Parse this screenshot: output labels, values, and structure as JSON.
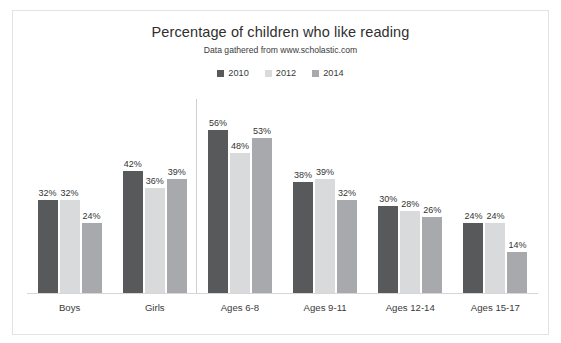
{
  "top_crumb": "",
  "chart_data": {
    "type": "bar",
    "title": "Percentage of children who like reading",
    "subtitle": "Data gathered from www.scholastic.com",
    "xlabel": "",
    "ylabel": "",
    "ylim": [
      0,
      60
    ],
    "grid": false,
    "legend_position": "top-center",
    "unit_suffix": "%",
    "categories": [
      "Boys",
      "Girls",
      "Ages 6-8",
      "Ages 9-11",
      "Ages 12-14",
      "Ages 15-17"
    ],
    "series": [
      {
        "name": "2010",
        "color": "#58595b",
        "values": [
          32,
          42,
          56,
          38,
          30,
          24
        ],
        "labels": [
          "32%",
          "42%",
          "56%",
          "38%",
          "30%",
          "24%"
        ]
      },
      {
        "name": "2012",
        "color": "#d9dadb",
        "values": [
          32,
          36,
          48,
          39,
          28,
          24
        ],
        "labels": [
          "32%",
          "36%",
          "48%",
          "39%",
          "28%",
          "24%"
        ]
      },
      {
        "name": "2014",
        "color": "#a7a9ac",
        "values": [
          24,
          39,
          53,
          32,
          26,
          14
        ],
        "labels": [
          "24%",
          "39%",
          "53%",
          "32%",
          "26%",
          "14%"
        ]
      }
    ]
  }
}
